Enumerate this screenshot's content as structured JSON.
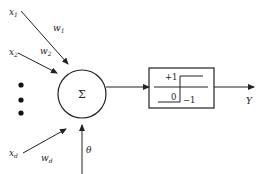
{
  "diagram": {
    "inputs": [
      {
        "name": "x1_label",
        "label": "x",
        "sub": "1",
        "weight": "w",
        "weight_sub": "1"
      },
      {
        "name": "x2_label",
        "label": "x",
        "sub": "2",
        "weight": "w",
        "weight_sub": "2"
      },
      {
        "name": "xd_label",
        "label": "x",
        "sub": "d",
        "weight": "w",
        "weight_sub": "d"
      }
    ],
    "summation_symbol": "Σ",
    "bias_label": "θ",
    "activation": {
      "plus": "+1",
      "zero": "0",
      "minus": "−1"
    },
    "output_label": "Y",
    "colors": {
      "stroke": "#222222",
      "background": "#ffffff"
    }
  }
}
